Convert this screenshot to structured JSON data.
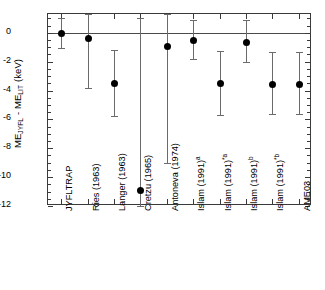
{
  "chart_data": {
    "type": "scatter",
    "title": "",
    "xlabel": "",
    "ylabel": "ME_JYFL - ME_LIT (keV)",
    "ylabel_parts": {
      "lead": "ME",
      "sub1": "JYFL",
      "mid": " - ME",
      "sub2": "LIT",
      "tail": "  (keV)"
    },
    "ylim": [
      -12,
      1.3
    ],
    "yticks": [
      0,
      -2,
      -4,
      -6,
      -8,
      -10,
      -12
    ],
    "ytick_labels": [
      "0",
      "-2",
      "-4",
      "-6",
      "-8",
      "-10",
      "-12"
    ],
    "minor_ticks": true,
    "grid": false,
    "zero_reference_line": 0,
    "legend": "none",
    "categories": [
      "JYFLTRAP",
      "Ries (1963)",
      "Langer (1963)",
      "Cretzu (1965)",
      "Antoneva (1974)",
      "Islam (1991)a",
      "Islam (1991)*a",
      "Islam (1991)b",
      "Islam (1991)*b",
      "AME03"
    ],
    "category_labels": [
      {
        "text": "JYFLTRAP",
        "sup": ""
      },
      {
        "text": "Ries (1963)",
        "sup": ""
      },
      {
        "text": "Langer (1963)",
        "sup": ""
      },
      {
        "text": "Cretzu (1965)",
        "sup": ""
      },
      {
        "text": "Antoneva (1974)",
        "sup": ""
      },
      {
        "text": "Islam (1991)",
        "sup": "a"
      },
      {
        "text": "Islam (1991)",
        "sup": "*a"
      },
      {
        "text": "Islam (1991)",
        "sup": "b"
      },
      {
        "text": "Islam (1991)",
        "sup": "*b"
      },
      {
        "text": "AME03",
        "sup": ""
      }
    ],
    "values": [
      0.0,
      -0.35,
      -3.45,
      -10.9,
      -0.95,
      -0.5,
      -3.5,
      -0.65,
      -3.55,
      -3.55
    ],
    "err_low": [
      -1.05,
      -3.8,
      -5.8,
      -12.0,
      -9.05,
      -1.8,
      -5.7,
      -2.05,
      -5.6,
      -5.65
    ],
    "err_high": [
      1.0,
      1.3,
      -1.2,
      1.05,
      1.3,
      0.85,
      -1.25,
      0.9,
      -1.3,
      -1.35
    ],
    "series": [
      {
        "name": "ME difference",
        "points": [
          {
            "category": "JYFLTRAP",
            "value": 0.0,
            "low": -1.05,
            "high": 1.0
          },
          {
            "category": "Ries (1963)",
            "value": -0.35,
            "low": -3.8,
            "high": 1.3
          },
          {
            "category": "Langer (1963)",
            "value": -3.45,
            "low": -5.8,
            "high": -1.2
          },
          {
            "category": "Cretzu (1965)",
            "value": -10.9,
            "low": -12.0,
            "high": 1.05
          },
          {
            "category": "Antoneva (1974)",
            "value": -0.95,
            "low": -9.05,
            "high": 1.3
          },
          {
            "category": "Islam (1991)a",
            "value": -0.5,
            "low": -1.8,
            "high": 0.85
          },
          {
            "category": "Islam (1991)*a",
            "value": -3.5,
            "low": -5.7,
            "high": -1.25
          },
          {
            "category": "Islam (1991)b",
            "value": -0.65,
            "low": -2.05,
            "high": 0.9
          },
          {
            "category": "Islam (1991)*b",
            "value": -3.55,
            "low": -5.6,
            "high": -1.3
          },
          {
            "category": "AME03",
            "value": -3.55,
            "low": -5.65,
            "high": -1.35
          }
        ]
      }
    ],
    "colors": {
      "marker": "#000000",
      "errorbar": "#6b6b6b",
      "axis": "#3a3a3a",
      "zero_line": "#4a4a4a",
      "background": "#ffffff"
    }
  }
}
